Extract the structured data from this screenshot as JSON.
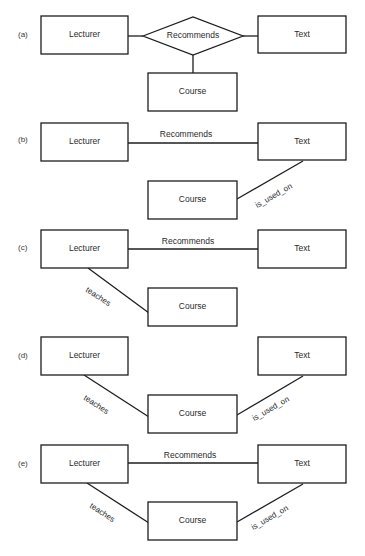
{
  "figure": {
    "panels": [
      {
        "id": "a",
        "label": "(a)",
        "label_pos": [
          18,
          37
        ],
        "entities": [
          {
            "name": "Lecturer",
            "x": 41,
            "y": 16,
            "w": 87,
            "h": 38
          },
          {
            "name": "Text",
            "x": 258,
            "y": 16,
            "w": 88,
            "h": 37
          },
          {
            "name": "Course",
            "x": 148,
            "y": 73,
            "w": 89,
            "h": 38
          }
        ],
        "diamond": {
          "label": "Recommends",
          "cx": 193,
          "cy": 36,
          "hw": 50,
          "hh": 19
        },
        "lines": [
          {
            "x1": 128,
            "y1": 36,
            "x2": 143,
            "y2": 36
          },
          {
            "x1": 243,
            "y1": 36,
            "x2": 258,
            "y2": 36
          },
          {
            "x1": 193,
            "y1": 55,
            "x2": 193,
            "y2": 73
          }
        ],
        "relationship_labels": []
      },
      {
        "id": "b",
        "label": "(b)",
        "label_pos": [
          18,
          142
        ],
        "entities": [
          {
            "name": "Lecturer",
            "x": 41,
            "y": 123,
            "w": 87,
            "h": 38
          },
          {
            "name": "Text",
            "x": 258,
            "y": 123,
            "w": 88,
            "h": 37
          },
          {
            "name": "Course",
            "x": 148,
            "y": 181,
            "w": 89,
            "h": 38
          }
        ],
        "lines": [
          {
            "x1": 128,
            "y1": 143,
            "x2": 258,
            "y2": 143
          },
          {
            "x1": 237,
            "y1": 199,
            "x2": 303,
            "y2": 161
          }
        ],
        "relationship_labels": [
          {
            "text": "Recommends",
            "x": 186,
            "y": 135,
            "rotate": 0
          },
          {
            "text": "is_used_on",
            "x": 274,
            "y": 196,
            "rotate": -30
          }
        ]
      },
      {
        "id": "c",
        "label": "(c)",
        "label_pos": [
          18,
          250
        ],
        "entities": [
          {
            "name": "Lecturer",
            "x": 41,
            "y": 230,
            "w": 87,
            "h": 38
          },
          {
            "name": "Text",
            "x": 258,
            "y": 230,
            "w": 88,
            "h": 38
          },
          {
            "name": "Course",
            "x": 148,
            "y": 288,
            "w": 89,
            "h": 38
          }
        ],
        "lines": [
          {
            "x1": 128,
            "y1": 249,
            "x2": 258,
            "y2": 249
          },
          {
            "x1": 88,
            "y1": 268,
            "x2": 149,
            "y2": 313
          }
        ],
        "relationship_labels": [
          {
            "text": "Recommends",
            "x": 188,
            "y": 242,
            "rotate": 0
          },
          {
            "text": "teaches",
            "x": 98,
            "y": 297,
            "rotate": 33
          }
        ]
      },
      {
        "id": "d",
        "label": "(d)",
        "label_pos": [
          18,
          358
        ],
        "entities": [
          {
            "name": "Lecturer",
            "x": 41,
            "y": 337,
            "w": 87,
            "h": 38
          },
          {
            "name": "Text",
            "x": 258,
            "y": 337,
            "w": 88,
            "h": 38
          },
          {
            "name": "Course",
            "x": 148,
            "y": 395,
            "w": 89,
            "h": 38
          }
        ],
        "lines": [
          {
            "x1": 84,
            "y1": 375,
            "x2": 149,
            "y2": 417
          },
          {
            "x1": 237,
            "y1": 415,
            "x2": 303,
            "y2": 376
          }
        ],
        "relationship_labels": [
          {
            "text": "teaches",
            "x": 96,
            "y": 405,
            "rotate": 33
          },
          {
            "text": "is_used_on",
            "x": 271,
            "y": 409,
            "rotate": -30
          }
        ]
      },
      {
        "id": "e",
        "label": "(e)",
        "label_pos": [
          18,
          466
        ],
        "entities": [
          {
            "name": "Lecturer",
            "x": 41,
            "y": 445,
            "w": 87,
            "h": 38
          },
          {
            "name": "Text",
            "x": 258,
            "y": 445,
            "w": 88,
            "h": 38
          },
          {
            "name": "Course",
            "x": 148,
            "y": 502,
            "w": 89,
            "h": 38
          }
        ],
        "lines": [
          {
            "x1": 128,
            "y1": 463,
            "x2": 258,
            "y2": 463
          },
          {
            "x1": 87,
            "y1": 483,
            "x2": 149,
            "y2": 523
          },
          {
            "x1": 237,
            "y1": 522,
            "x2": 303,
            "y2": 484
          }
        ],
        "relationship_labels": [
          {
            "text": "Recommends",
            "x": 190,
            "y": 456,
            "rotate": 0
          },
          {
            "text": "teaches",
            "x": 102,
            "y": 513,
            "rotate": 33
          },
          {
            "text": "is_used_on",
            "x": 270,
            "y": 518,
            "rotate": -30
          }
        ]
      }
    ]
  }
}
